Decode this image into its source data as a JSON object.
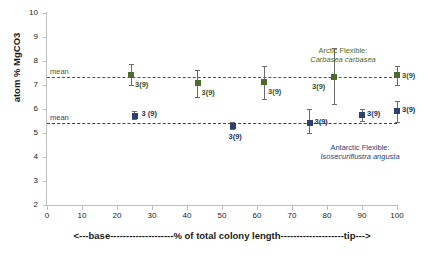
{
  "chart_data": {
    "type": "scatter",
    "title": "",
    "xlabel": "<---base--------------------% of total  colony length--------------------tip--->",
    "ylabel": "atom % MgCO3",
    "xlim": [
      0,
      100
    ],
    "ylim": [
      2,
      10
    ],
    "grid": false,
    "legend_position": "inline-annotation",
    "y_ticks": [
      2,
      3,
      4,
      5,
      6,
      7,
      8,
      9,
      10
    ],
    "x_ticks": [
      0,
      10,
      20,
      30,
      40,
      50,
      60,
      70,
      80,
      90,
      100
    ],
    "reference_lines": [
      {
        "name": "mean",
        "label": "mean",
        "value": 7.35,
        "series": "arctic",
        "color": "#4a5e33",
        "style": "dashed"
      },
      {
        "name": "mean",
        "label": "mean",
        "value": 5.4,
        "series": "antarctic",
        "color": "#2e4272",
        "style": "dashed"
      }
    ],
    "series": [
      {
        "name": "Arctic Flexible: Carbasea carbasea",
        "group_label": "Arctic Flexible:",
        "species": "Carbasea carbasea",
        "color": "#4e6b2f",
        "marker": "square",
        "points": [
          {
            "x": 24,
            "y": 7.42,
            "err_low": 7.0,
            "err_high": 7.88,
            "label": "3(9)"
          },
          {
            "x": 43,
            "y": 7.1,
            "err_low": 6.52,
            "err_high": 7.62,
            "label": "3(9)"
          },
          {
            "x": 62,
            "y": 7.12,
            "err_low": 6.4,
            "err_high": 7.78,
            "label": "3(9)"
          },
          {
            "x": 82,
            "y": 7.35,
            "err_low": 6.2,
            "err_high": 8.55,
            "label": "3(9)"
          },
          {
            "x": 100,
            "y": 7.42,
            "err_low": 7.02,
            "err_high": 7.8,
            "label": "3(9)"
          }
        ]
      },
      {
        "name": "Antarctic Flexible: Isosecuriflustra angusta",
        "group_label": "Antarctic Flexible:",
        "species": "Isosecuriflustra angusta",
        "color": "#2e4272",
        "marker": "square",
        "points": [
          {
            "x": 25,
            "y": 5.72,
            "err_low": 5.58,
            "err_high": 5.9,
            "label": "3 (9)"
          },
          {
            "x": 53,
            "y": 5.3,
            "err_low": 5.18,
            "err_high": 5.45,
            "label": "3(9)"
          },
          {
            "x": 75,
            "y": 5.4,
            "err_low": 5.02,
            "err_high": 5.98,
            "label": "3(9)"
          },
          {
            "x": 90,
            "y": 5.76,
            "err_low": 5.5,
            "err_high": 6.02,
            "label": "3(9)"
          },
          {
            "x": 100,
            "y": 5.92,
            "err_low": 5.44,
            "err_high": 6.34,
            "label": "3(9)"
          }
        ]
      }
    ]
  }
}
